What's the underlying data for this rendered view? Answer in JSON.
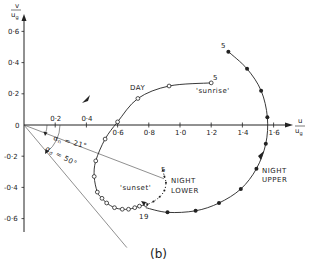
{
  "figure": {
    "caption": "(b)",
    "x_axis_label_num": "u",
    "x_axis_label_den": "u",
    "x_axis_label_sub": "g",
    "y_axis_label_num": "v",
    "y_axis_label_den": "u",
    "y_axis_label_sub": "g",
    "x_ticks": [
      {
        "v": 0.2,
        "t": "0·2"
      },
      {
        "v": 0.4,
        "t": "0·4"
      },
      {
        "v": 0.6,
        "t": "0·6"
      },
      {
        "v": 0.8,
        "t": "0·8"
      },
      {
        "v": 1.0,
        "t": "1·0"
      },
      {
        "v": 1.2,
        "t": "1·2"
      },
      {
        "v": 1.4,
        "t": "1·4"
      },
      {
        "v": 1.6,
        "t": "1·6"
      }
    ],
    "y_ticks": [
      {
        "v": 0.6,
        "t": "0·6"
      },
      {
        "v": 0.4,
        "t": "0·4"
      },
      {
        "v": 0.2,
        "t": "0·2"
      },
      {
        "v": 0,
        "t": "0"
      },
      {
        "v": -0.2,
        "t": "-0·2"
      },
      {
        "v": -0.4,
        "t": "-0·4"
      },
      {
        "v": -0.6,
        "t": "-0·6"
      }
    ],
    "angles": {
      "alpha_n": {
        "symbol": "α",
        "sub": "n",
        "text": " = 21°",
        "deg": 21
      },
      "alpha_sigma": {
        "symbol": "α",
        "sub": "σ",
        "text": " = 50°",
        "deg": 50
      }
    },
    "labels": {
      "day": "DAY",
      "sunrise": "'sunrise'",
      "sunset": "'sunset'",
      "night_upper_1": "NIGHT",
      "night_upper_2": "UPPER",
      "night_lower_1": "NIGHT",
      "night_lower_2": "LOWER",
      "hour_5_day": "5",
      "hour_5_upper": "5",
      "hour_5_lower": "5",
      "hour_19": "19"
    },
    "series": {
      "day": {
        "marker": "open-circle",
        "points": [
          [
            1.2,
            0.27
          ],
          [
            0.93,
            0.25
          ],
          [
            0.73,
            0.17
          ],
          [
            0.6,
            0.02
          ],
          [
            0.52,
            -0.09
          ],
          [
            0.46,
            -0.23
          ],
          [
            0.45,
            -0.33
          ],
          [
            0.47,
            -0.43
          ],
          [
            0.5,
            -0.47
          ],
          [
            0.53,
            -0.5
          ],
          [
            0.58,
            -0.53
          ],
          [
            0.63,
            -0.54
          ],
          [
            0.67,
            -0.54
          ],
          [
            0.71,
            -0.53
          ],
          [
            0.74,
            -0.52
          ],
          [
            0.78,
            -0.51
          ]
        ]
      },
      "night_upper": {
        "marker": "filled-dot",
        "points": [
          [
            1.31,
            0.47
          ],
          [
            1.43,
            0.36
          ],
          [
            1.52,
            0.22
          ],
          [
            1.56,
            0.05
          ],
          [
            1.55,
            -0.12
          ],
          [
            1.49,
            -0.28
          ],
          [
            1.39,
            -0.41
          ],
          [
            1.25,
            -0.5
          ],
          [
            1.1,
            -0.55
          ],
          [
            0.92,
            -0.56
          ],
          [
            0.78,
            -0.53
          ]
        ]
      },
      "night_lower": {
        "marker": "small-dot",
        "points": [
          [
            0.89,
            -0.29
          ],
          [
            0.9,
            -0.33
          ],
          [
            0.91,
            -0.37
          ],
          [
            0.9,
            -0.42
          ],
          [
            0.87,
            -0.46
          ],
          [
            0.83,
            -0.49
          ],
          [
            0.79,
            -0.51
          ]
        ]
      }
    }
  }
}
